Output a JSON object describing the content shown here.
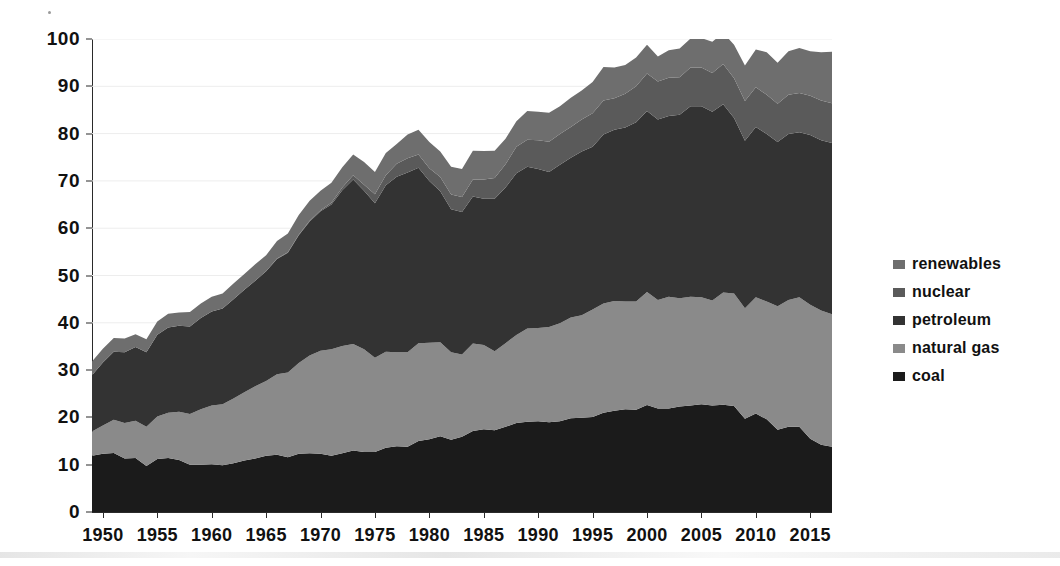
{
  "chart_data": {
    "type": "area",
    "stacked": true,
    "title": "",
    "subtitle": "",
    "xlabel": "",
    "ylabel": "",
    "xlim": [
      1949,
      2017
    ],
    "ylim": [
      0,
      100
    ],
    "xticks": [
      1950,
      1955,
      1960,
      1965,
      1970,
      1975,
      1980,
      1985,
      1990,
      1995,
      2000,
      2005,
      2010,
      2015
    ],
    "yticks": [
      0,
      10,
      20,
      30,
      40,
      50,
      60,
      70,
      80,
      90,
      100
    ],
    "grid": true,
    "grid_axis": "y",
    "legend_position": "right",
    "stack_order_bottom_to_top": [
      "coal",
      "natural gas",
      "petroleum",
      "nuclear",
      "renewables"
    ],
    "x": [
      1949,
      1950,
      1951,
      1952,
      1953,
      1954,
      1955,
      1956,
      1957,
      1958,
      1959,
      1960,
      1961,
      1962,
      1963,
      1964,
      1965,
      1966,
      1967,
      1968,
      1969,
      1970,
      1971,
      1972,
      1973,
      1974,
      1975,
      1976,
      1977,
      1978,
      1979,
      1980,
      1981,
      1982,
      1983,
      1984,
      1985,
      1986,
      1987,
      1988,
      1989,
      1990,
      1991,
      1992,
      1993,
      1994,
      1995,
      1996,
      1997,
      1998,
      1999,
      2000,
      2001,
      2002,
      2003,
      2004,
      2005,
      2006,
      2007,
      2008,
      2009,
      2010,
      2011,
      2012,
      2013,
      2014,
      2015,
      2016,
      2017
    ],
    "series": [
      {
        "name": "coal",
        "color": "#1b1b1b",
        "values": [
          11.9,
          12.3,
          12.5,
          11.3,
          11.4,
          9.7,
          11.2,
          11.4,
          11.0,
          10.0,
          10.0,
          10.1,
          9.9,
          10.3,
          10.9,
          11.3,
          11.9,
          12.1,
          11.6,
          12.3,
          12.4,
          12.3,
          11.9,
          12.4,
          13.0,
          12.7,
          12.7,
          13.6,
          13.9,
          13.8,
          15.0,
          15.4,
          16.0,
          15.3,
          15.9,
          17.1,
          17.5,
          17.3,
          18.0,
          18.8,
          19.1,
          19.2,
          19.0,
          19.2,
          19.8,
          19.9,
          20.1,
          21.0,
          21.4,
          21.7,
          21.6,
          22.6,
          21.9,
          21.9,
          22.3,
          22.5,
          22.8,
          22.5,
          22.7,
          22.4,
          19.7,
          20.8,
          19.6,
          17.4,
          18.0,
          18.0,
          15.5,
          14.2,
          13.8
        ]
      },
      {
        "name": "natural gas",
        "color": "#8a8a8a",
        "values": [
          5.1,
          6.0,
          7.0,
          7.5,
          7.9,
          8.3,
          9.0,
          9.6,
          10.2,
          10.7,
          11.7,
          12.4,
          12.9,
          13.7,
          14.4,
          15.3,
          15.8,
          17.0,
          17.9,
          19.2,
          20.7,
          21.8,
          22.5,
          22.7,
          22.5,
          21.7,
          19.9,
          20.3,
          19.9,
          20.0,
          20.7,
          20.4,
          19.9,
          18.5,
          17.4,
          18.5,
          17.8,
          16.7,
          17.7,
          18.6,
          19.7,
          19.7,
          20.1,
          20.7,
          21.3,
          21.7,
          22.7,
          23.1,
          23.2,
          22.8,
          22.9,
          23.9,
          22.9,
          23.6,
          22.9,
          23.0,
          22.6,
          22.2,
          23.7,
          23.8,
          23.4,
          24.6,
          24.9,
          26.1,
          26.8,
          27.4,
          28.3,
          28.4,
          28.0
        ]
      },
      {
        "name": "petroleum",
        "color": "#333333",
        "values": [
          11.9,
          13.3,
          14.4,
          15.0,
          15.6,
          15.8,
          17.3,
          18.0,
          18.2,
          18.5,
          19.3,
          19.9,
          20.2,
          21.0,
          21.7,
          22.3,
          23.2,
          24.4,
          25.3,
          27.0,
          28.3,
          29.5,
          30.6,
          32.9,
          34.8,
          33.5,
          32.7,
          35.2,
          37.1,
          38.0,
          37.1,
          34.2,
          31.9,
          30.2,
          30.1,
          31.1,
          30.9,
          32.2,
          32.9,
          34.2,
          34.2,
          33.6,
          32.8,
          33.5,
          33.8,
          34.6,
          34.4,
          35.7,
          36.2,
          36.8,
          37.9,
          38.3,
          38.2,
          38.2,
          38.8,
          40.3,
          40.4,
          39.9,
          39.8,
          37.1,
          35.4,
          36.0,
          35.4,
          34.7,
          35.1,
          34.9,
          35.9,
          36.0,
          36.2
        ]
      },
      {
        "name": "nuclear",
        "color": "#5a5a5a",
        "values": [
          0.0,
          0.0,
          0.0,
          0.0,
          0.0,
          0.0,
          0.0,
          0.0,
          0.0,
          0.0,
          0.0,
          0.0,
          0.0,
          0.0,
          0.0,
          0.0,
          0.0,
          0.1,
          0.1,
          0.1,
          0.2,
          0.2,
          0.4,
          0.6,
          0.9,
          1.3,
          1.9,
          2.1,
          2.7,
          3.0,
          2.8,
          2.7,
          3.0,
          3.1,
          3.2,
          3.6,
          4.1,
          4.4,
          4.9,
          5.6,
          5.7,
          6.1,
          6.4,
          6.5,
          6.5,
          6.8,
          7.1,
          7.2,
          6.7,
          7.1,
          7.6,
          7.9,
          8.0,
          8.1,
          7.9,
          8.2,
          8.2,
          8.2,
          8.5,
          8.4,
          8.4,
          8.4,
          8.3,
          8.1,
          8.3,
          8.3,
          8.3,
          8.4,
          8.4
        ]
      },
      {
        "name": "renewables",
        "color": "#6e6e6e",
        "values": [
          2.9,
          2.9,
          2.9,
          2.9,
          2.7,
          2.7,
          2.8,
          2.9,
          2.8,
          3.1,
          3.1,
          3.1,
          3.2,
          3.3,
          3.3,
          3.5,
          3.4,
          3.7,
          4.0,
          4.2,
          4.2,
          4.1,
          4.2,
          4.3,
          4.4,
          4.8,
          4.7,
          4.7,
          4.2,
          5.0,
          5.2,
          5.5,
          5.4,
          5.9,
          5.9,
          6.1,
          6.0,
          5.8,
          5.4,
          5.4,
          6.1,
          6.0,
          6.1,
          5.9,
          6.2,
          6.1,
          6.6,
          7.1,
          6.5,
          6.1,
          6.1,
          6.1,
          5.3,
          5.8,
          6.1,
          6.1,
          6.2,
          6.6,
          6.6,
          7.1,
          7.5,
          8.0,
          9.0,
          8.7,
          9.2,
          9.5,
          9.4,
          10.2,
          10.9
        ]
      }
    ]
  },
  "legend": {
    "items": [
      {
        "label": "renewables",
        "color": "#6e6e6e"
      },
      {
        "label": "nuclear",
        "color": "#5a5a5a"
      },
      {
        "label": "petroleum",
        "color": "#333333"
      },
      {
        "label": "natural gas",
        "color": "#8a8a8a"
      },
      {
        "label": "coal",
        "color": "#1b1b1b"
      }
    ]
  },
  "axes": {
    "y_tick_labels": [
      "100",
      "90",
      "80",
      "70",
      "60",
      "50",
      "40",
      "30",
      "20",
      "10",
      "0"
    ],
    "x_tick_labels": [
      "1950",
      "1955",
      "1960",
      "1965",
      "1970",
      "1975",
      "1980",
      "1985",
      "1990",
      "1995",
      "2000",
      "2005",
      "2010",
      "2015"
    ]
  },
  "colors": {
    "background": "#ffffff",
    "axis": "#2a2a2a",
    "grid": "#ededed",
    "text": "#111111"
  }
}
